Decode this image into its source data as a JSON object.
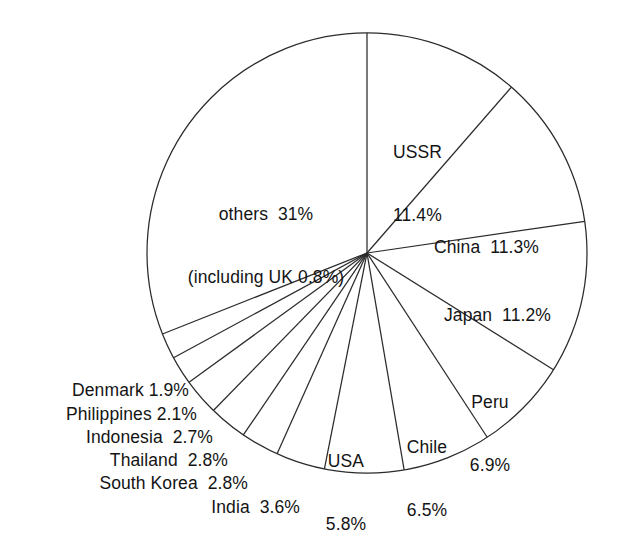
{
  "figure": {
    "background_color": "#ffffff",
    "stroke_color": "#2b2b2b",
    "text_color": "#141414",
    "top_edge_remnant": "      "
  },
  "chart_data": {
    "type": "pie",
    "title": "",
    "subtitle": "",
    "xlabel": "",
    "ylabel": "",
    "unit": "%",
    "start_angle_deg": 0,
    "direction": "clockwise",
    "grid": false,
    "legend": "none (labels placed on/next to slices)",
    "categories": [
      "USSR",
      "China",
      "Japan",
      "Peru",
      "Chile",
      "USA",
      "India",
      "South Korea",
      "Thailand",
      "Indonesia",
      "Philippines",
      "Denmark",
      "others"
    ],
    "values": [
      11.4,
      11.3,
      11.2,
      6.9,
      6.5,
      5.8,
      3.6,
      2.8,
      2.8,
      2.7,
      2.1,
      1.9,
      31.0
    ],
    "annotations": [
      {
        "name": "others",
        "line1": "others  31%",
        "line2": "(including UK 0.8%)"
      }
    ],
    "slices": [
      {
        "name": "USSR",
        "value": 11.4,
        "label_line1": "USSR",
        "label_line2": "11.4%",
        "label_text": "USSR 11.4%"
      },
      {
        "name": "China",
        "value": 11.3,
        "label_line1": "China  11.3%",
        "label_line2": "",
        "label_text": "China 11.3%"
      },
      {
        "name": "Japan",
        "value": 11.2,
        "label_line1": "Japan  11.2%",
        "label_line2": "",
        "label_text": "Japan 11.2%"
      },
      {
        "name": "Peru",
        "value": 6.9,
        "label_line1": "Peru",
        "label_line2": "6.9%",
        "label_text": "Peru 6.9%"
      },
      {
        "name": "Chile",
        "value": 6.5,
        "label_line1": "Chile",
        "label_line2": "6.5%",
        "label_text": "Chile 6.5%"
      },
      {
        "name": "USA",
        "value": 5.8,
        "label_line1": "USA",
        "label_line2": "5.8%",
        "label_text": "USA 5.8%"
      },
      {
        "name": "India",
        "value": 3.6,
        "label_line1": "India  3.6%",
        "label_line2": "",
        "label_text": "India 3.6%"
      },
      {
        "name": "South Korea",
        "value": 2.8,
        "label_line1": "South Korea  2.8%",
        "label_line2": "",
        "label_text": "South Korea 2.8%"
      },
      {
        "name": "Thailand",
        "value": 2.8,
        "label_line1": "Thailand  2.8%",
        "label_line2": "",
        "label_text": "Thailand 2.8%"
      },
      {
        "name": "Indonesia",
        "value": 2.7,
        "label_line1": "Indonesia  2.7%",
        "label_line2": "",
        "label_text": "Indonesia 2.7%"
      },
      {
        "name": "Philippines",
        "value": 2.1,
        "label_line1": "Philippines 2.1%",
        "label_line2": "",
        "label_text": "Philippines 2.1%"
      },
      {
        "name": "Denmark",
        "value": 1.9,
        "label_line1": "Denmark 1.9%",
        "label_line2": "",
        "label_text": "Denmark 1.9%"
      },
      {
        "name": "others",
        "value": 31.0,
        "label_line1": "others  31%",
        "label_line2": "(including UK 0.8%)",
        "label_text": "others 31% (including UK 0.8%)"
      }
    ],
    "geometry": {
      "center_x": 367,
      "center_y": 253,
      "radius": 220
    }
  }
}
